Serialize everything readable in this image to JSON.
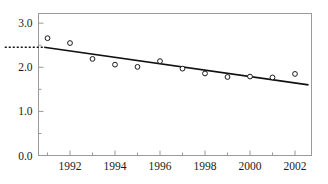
{
  "chart_data": {
    "type": "scatter",
    "title": "",
    "subtitle": "",
    "xlabel": "",
    "ylabel": "",
    "xlim": [
      1990.4,
      1990.4
    ],
    "ylim": [
      0.0,
      3.22
    ],
    "grid": false,
    "legend": "none",
    "x": [
      1991,
      1992,
      1993,
      1994,
      1995,
      1996,
      1997,
      1998,
      1999,
      2000,
      2001,
      2002
    ],
    "values": [
      2.66,
      2.55,
      2.19,
      2.06,
      2.01,
      2.14,
      1.97,
      1.86,
      1.78,
      1.79,
      1.77,
      1.85
    ],
    "series": [
      {
        "name": "observations",
        "marker": "open-circle",
        "values": [
          2.66,
          2.55,
          2.19,
          2.06,
          2.01,
          2.14,
          1.97,
          1.86,
          1.78,
          1.79,
          1.77,
          1.85
        ]
      },
      {
        "name": "fitted-trend-line",
        "type": "line",
        "x": [
          1990.85,
          2002.6
        ],
        "values": [
          2.455,
          1.6
        ]
      }
    ],
    "annotations": [
      {
        "name": "intercept-dotted-marker",
        "style": "dotted",
        "y": 2.455,
        "x_from": 1989.1,
        "x_to": 1990.85
      }
    ],
    "y_axis": {
      "ticks_major": [
        0.0,
        1.0,
        2.0,
        3.0
      ],
      "tick_labels": [
        "0.0",
        "1.0",
        "2.0",
        "3.0"
      ],
      "ticks_minor": [
        0.5,
        1.5,
        2.5
      ]
    },
    "x_axis": {
      "ticks_major": [
        1992,
        1994,
        1996,
        1998,
        2000,
        2002
      ],
      "tick_labels": [
        "1992",
        "1994",
        "1996",
        "1998",
        "2000",
        "2002"
      ],
      "ticks_minor": [
        1991,
        1993,
        1995,
        1997,
        1999,
        2001
      ]
    },
    "colors": {
      "frame": "#9a9a9a",
      "marker_stroke": "#1a1a1a",
      "marker_fill": "#ffffff",
      "trend_line": "#111111",
      "text": "#1a1a1a",
      "background": "#ffffff"
    }
  }
}
